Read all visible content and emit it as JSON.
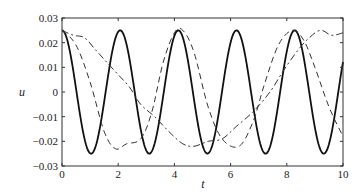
{
  "chart_data": {
    "type": "line",
    "title": "",
    "xlabel": "t",
    "ylabel": "u",
    "xlim": [
      0,
      10
    ],
    "ylim": [
      -0.03,
      0.03
    ],
    "grid": false,
    "legend": null,
    "x_ticks": [
      "0",
      "2",
      "4",
      "6",
      "8",
      "10"
    ],
    "y_ticks": [
      "0.03",
      "0.02",
      "0.01",
      "0",
      "−0.01",
      "−0.02",
      "−0.03"
    ],
    "series": [
      {
        "name": "solid",
        "style": "solid",
        "color": "#111111",
        "description": "u = 0.025 cos(2π t / 2.07)",
        "x": [
          0,
          0.5,
          1.0,
          1.5,
          2.0,
          2.5,
          3.0,
          3.5,
          4.0,
          4.5,
          5.0,
          5.5,
          6.0,
          6.5,
          7.0,
          7.5,
          8.0,
          8.5,
          9.0,
          9.5,
          10.0
        ],
        "values": [
          0.025,
          0.0002,
          -0.025,
          -0.0005,
          0.025,
          0.0008,
          -0.0249,
          -0.0012,
          0.0247,
          0.0016,
          -0.0246,
          -0.002,
          0.0244,
          0.0024,
          -0.0242,
          -0.0028,
          0.024,
          0.0032,
          -0.0238,
          -0.0035,
          0.005
        ]
      },
      {
        "name": "dashed",
        "style": "dashed",
        "color": "#333333",
        "x": [
          0,
          0.5,
          1.0,
          1.5,
          1.9,
          2.3,
          2.8,
          3.2,
          3.6,
          4.0,
          4.3,
          4.7,
          5.2,
          5.7,
          6.3,
          6.8,
          7.2,
          7.7,
          8.2,
          8.6,
          9.0,
          9.5,
          10.0
        ],
        "values": [
          0.025,
          0.019,
          0.004,
          -0.016,
          -0.023,
          -0.021,
          -0.019,
          -0.008,
          0.012,
          0.024,
          0.025,
          0.016,
          -0.006,
          -0.019,
          -0.022,
          -0.012,
          0.003,
          0.019,
          0.025,
          0.021,
          0.01,
          -0.006,
          -0.018
        ]
      },
      {
        "name": "dash-dot",
        "style": "dashdot",
        "color": "#333333",
        "x": [
          0,
          0.4,
          0.8,
          1.2,
          1.6,
          2.0,
          2.4,
          2.8,
          3.3,
          3.8,
          4.3,
          4.7,
          5.2,
          5.7,
          6.2,
          6.8,
          7.4,
          7.9,
          8.4,
          8.8,
          9.2,
          9.6,
          10.0
        ],
        "values": [
          0.025,
          0.023,
          0.022,
          0.017,
          0.012,
          0.007,
          0.002,
          -0.005,
          -0.01,
          -0.016,
          -0.021,
          -0.022,
          -0.02,
          -0.019,
          -0.014,
          -0.008,
          0.0,
          0.009,
          0.017,
          0.022,
          0.025,
          0.023,
          0.024
        ]
      }
    ]
  }
}
